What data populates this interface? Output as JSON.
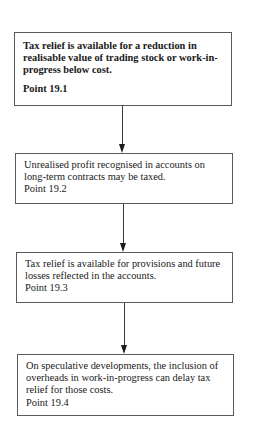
{
  "flowchart": {
    "steps": [
      {
        "text": "Tax relief is available for a reduction in realisable value of trading stock or work-in-progress below cost.",
        "point": "Point 19.1",
        "bold": true
      },
      {
        "text": "Unrealised profit recognised in accounts on long-term contracts may be taxed.",
        "point": "Point 19.2",
        "bold": false
      },
      {
        "text": "Tax relief is available for provisions and future losses reflected in the accounts.",
        "point": "Point 19.3",
        "bold": false
      },
      {
        "text": "On speculative developments, the inclusion of overheads in work-in-progress can delay tax relief for those costs.",
        "point": "Point 19.4",
        "bold": false
      }
    ],
    "connectors": [
      {
        "from": 1,
        "to": 2,
        "icon": "arrow-down-icon"
      },
      {
        "from": 2,
        "to": 3,
        "icon": "arrow-down-icon"
      },
      {
        "from": 3,
        "to": 4,
        "icon": "arrow-down-icon"
      }
    ]
  }
}
